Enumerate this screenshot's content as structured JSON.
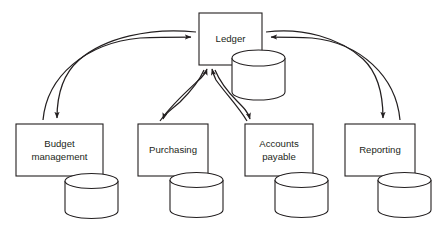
{
  "diagram": {
    "type": "system-flow-diagram",
    "background_color": "#ffffff",
    "line_color": "#231f20",
    "text_color": "#231f20",
    "nodes": [
      {
        "id": "ledger",
        "label": "Ledger",
        "label_lines": [
          "Ledger"
        ],
        "role": "central-hub",
        "has_database": true,
        "box": {
          "x": 199,
          "y": 13,
          "w": 63,
          "h": 52
        },
        "database": {
          "x": 232,
          "y": 50,
          "w": 53,
          "h": 50
        }
      },
      {
        "id": "budget-management",
        "label": "Budget management",
        "label_lines": [
          "Budget",
          "management"
        ],
        "role": "subsystem",
        "has_database": true,
        "box": {
          "x": 16,
          "y": 124,
          "w": 87,
          "h": 52
        },
        "database": {
          "x": 65,
          "y": 174,
          "w": 53,
          "h": 45
        }
      },
      {
        "id": "purchasing",
        "label": "Purchasing",
        "label_lines": [
          "Purchasing"
        ],
        "role": "subsystem",
        "has_database": true,
        "box": {
          "x": 138,
          "y": 124,
          "w": 70,
          "h": 52
        },
        "database": {
          "x": 170,
          "y": 173,
          "w": 53,
          "h": 45
        }
      },
      {
        "id": "accounts-payable",
        "label": "Accounts payable",
        "label_lines": [
          "Accounts",
          "payable"
        ],
        "role": "subsystem",
        "has_database": true,
        "box": {
          "x": 245,
          "y": 124,
          "w": 68,
          "h": 52
        },
        "database": {
          "x": 275,
          "y": 173,
          "w": 53,
          "h": 45
        }
      },
      {
        "id": "reporting",
        "label": "Reporting",
        "label_lines": [
          "Reporting"
        ],
        "role": "subsystem",
        "has_database": true,
        "box": {
          "x": 345,
          "y": 124,
          "w": 70,
          "h": 52
        },
        "database": {
          "x": 378,
          "y": 173,
          "w": 53,
          "h": 45
        }
      }
    ],
    "connections": [
      {
        "id": "budget-to-ledger",
        "from": "budget-management",
        "to": "ledger",
        "style": "curved-arrow"
      },
      {
        "id": "ledger-to-budget",
        "from": "ledger",
        "to": "budget-management",
        "style": "curved-arrow"
      },
      {
        "id": "purchasing-to-ledger",
        "from": "purchasing",
        "to": "ledger",
        "style": "curved-arrow"
      },
      {
        "id": "ledger-to-purchasing",
        "from": "ledger",
        "to": "purchasing",
        "style": "curved-arrow"
      },
      {
        "id": "accounts-payable-to-ledger",
        "from": "accounts-payable",
        "to": "ledger",
        "style": "curved-arrow"
      },
      {
        "id": "ledger-to-accounts-payable",
        "from": "ledger",
        "to": "accounts-payable",
        "style": "curved-arrow"
      },
      {
        "id": "reporting-to-ledger",
        "from": "reporting",
        "to": "ledger",
        "style": "curved-arrow"
      },
      {
        "id": "ledger-to-reporting",
        "from": "ledger",
        "to": "reporting",
        "style": "curved-arrow"
      }
    ]
  }
}
